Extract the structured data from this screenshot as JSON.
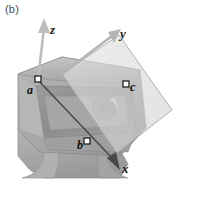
{
  "figure": {
    "panel_label": "(b)",
    "caption_position": "top-left",
    "background_color": "#ffffff"
  },
  "axes": {
    "origin_label": "",
    "items": [
      {
        "name": "z",
        "label": "z",
        "direction": "up",
        "color": "#b8b8b8"
      },
      {
        "name": "y",
        "label": "y",
        "direction": "up-right",
        "color": "#b0b0b0"
      },
      {
        "name": "x",
        "label": "x",
        "direction": "down-right",
        "color": "#5a5a5a"
      }
    ]
  },
  "points": [
    {
      "name": "a",
      "label": "a",
      "marker": "open-square",
      "x": 38,
      "y": 80
    },
    {
      "name": "b",
      "label": "b",
      "marker": "open-square",
      "x": 87,
      "y": 142
    },
    {
      "name": "c",
      "label": "c",
      "marker": "open-square",
      "x": 126,
      "y": 84
    }
  ],
  "lines": [
    {
      "name": "line-ab",
      "from": "a",
      "to": "b",
      "color": "#3b3b3b",
      "style": "solid"
    }
  ],
  "plane": {
    "name": "section-plane",
    "shape": "quadrilateral",
    "fill": "#d7d7d7",
    "opacity": 0.55,
    "stroke": "#9a9a9a"
  },
  "part": {
    "name": "machined-bracket",
    "material_color": "#a9a9a9",
    "highlight_color": "#c6c6c6",
    "shadow_color": "#8a8a8a",
    "features": [
      {
        "name": "through-hole",
        "shape": "circle",
        "cx": 105,
        "cy": 107,
        "r": 13
      },
      {
        "name": "pocket-recess",
        "shape": "quadrilateral"
      },
      {
        "name": "fillet-base",
        "shape": "concave-flare"
      }
    ]
  }
}
